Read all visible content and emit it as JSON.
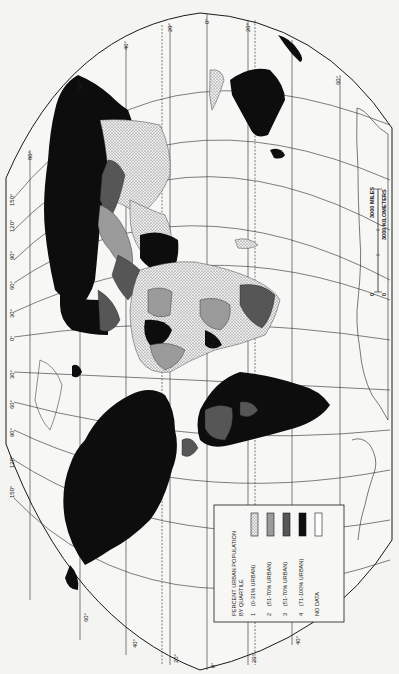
{
  "map": {
    "title": "Percent Urban Population by Quartile",
    "orientation": "rotated 90 degrees clockwise (north at left)",
    "projection_frame": "oval world projection",
    "colors": {
      "background": "#f4f4f2",
      "ink": "#1a1a1a",
      "q1_fill": "#e6e6e6",
      "q2_fill": "#9a9a9a",
      "q3_fill": "#5a5a5a",
      "q4_fill": "#0d0d0d",
      "no_data_fill": "#ffffff"
    },
    "legend": {
      "title_line1": "PERCENT URBAN POPULATION",
      "title_line2": "BY QUARTILE",
      "items": [
        {
          "num": "1",
          "label": "(0-31% URBAN)",
          "pattern": "dotted-light"
        },
        {
          "num": "2",
          "label": "(51-70% URBAN)",
          "pattern": "medium-gray"
        },
        {
          "num": "3",
          "label": "(51-70% URBAN)",
          "pattern": "dark-gray"
        },
        {
          "num": "4",
          "label": "(71-100% URBAN)",
          "pattern": "black"
        },
        {
          "num": "",
          "label": "NO DATA",
          "pattern": "white"
        }
      ]
    },
    "scale_bar": {
      "miles": "3000 MILES",
      "kilometers": "3000 KILOMETERS",
      "zero_top": "0",
      "zero_bottom": "0"
    },
    "longitude_labels_left": [
      "150°",
      "120°",
      "90°",
      "60°",
      "30°",
      "0°",
      "30°",
      "60°",
      "90°",
      "120°",
      "150°"
    ],
    "latitude_labels_top": [
      "80°",
      "60°",
      "40°",
      "20°",
      "0°",
      "20°",
      "40°",
      "60°"
    ],
    "latitude_labels_bottom": [
      "60°",
      "40°",
      "20°",
      "0°",
      "20°",
      "40°"
    ]
  }
}
